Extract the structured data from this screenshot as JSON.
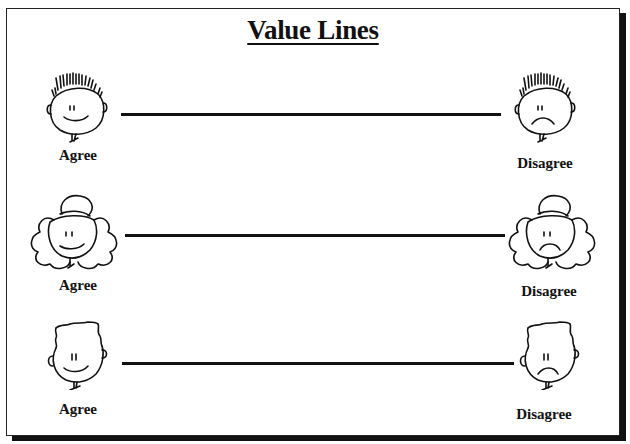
{
  "page": {
    "title": "Value Lines"
  },
  "rows": [
    {
      "face_style": "spiky-hair-boy",
      "left": {
        "label": "Agree",
        "expression": "smile"
      },
      "right": {
        "label": "Disagree",
        "expression": "frown"
      }
    },
    {
      "face_style": "curly-hair-girl",
      "left": {
        "label": "Agree",
        "expression": "smile"
      },
      "right": {
        "label": "Disagree",
        "expression": "frown"
      }
    },
    {
      "face_style": "flat-top-boy",
      "left": {
        "label": "Agree",
        "expression": "smile"
      },
      "right": {
        "label": "Disagree",
        "expression": "frown"
      }
    }
  ],
  "colors": {
    "ink": "#111111",
    "paper": "#ffffff"
  }
}
